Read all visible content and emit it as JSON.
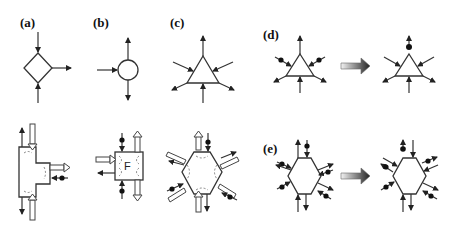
{
  "figure": {
    "panels": [
      {
        "id": "a",
        "label": "(a)",
        "shape": "diamond",
        "description": "Node with two inputs and one output"
      },
      {
        "id": "b",
        "label": "(b)",
        "shape": "circle",
        "description": "Node with one input and two outputs"
      },
      {
        "id": "c",
        "label": "(c)",
        "shape": "triangle",
        "description": "Triangle node with three inputs and three outputs"
      },
      {
        "id": "d",
        "label": "(d)",
        "shape": "triangle",
        "description": "Triangle transformation: dotted arcs merge into one"
      },
      {
        "id": "e",
        "label": "(e)",
        "shape": "hexagon",
        "description": "Hexagon transformation: dotted arcs rearranged"
      }
    ],
    "bottom_row": [
      {
        "id": "a-detail",
        "shape": "t-block",
        "description": "Detailed T-shaped block with hollow flow arrows"
      },
      {
        "id": "b-detail",
        "shape": "square",
        "inner_label": "F",
        "description": "Square block labeled F with hollow flow arrows"
      },
      {
        "id": "c-detail",
        "shape": "hexagon",
        "description": "Hexagon with hollow flow arrows and dashed arcs"
      }
    ],
    "transform_arrow": "gradient-arrow-icon"
  }
}
